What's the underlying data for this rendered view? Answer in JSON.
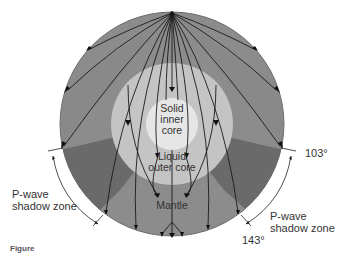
{
  "diagram": {
    "layers": [
      {
        "name": "Solid inner core",
        "lines": [
          "Solid",
          "inner",
          "core"
        ],
        "color": "#e6e6e6"
      },
      {
        "name": "Liquid outer core",
        "lines": [
          "Liquid",
          "outer core"
        ],
        "color": "#c4c4c4"
      },
      {
        "name": "Mantle",
        "lines": [
          "Mantle"
        ],
        "color": "#8c8c8c"
      }
    ],
    "shadow_zone_color": "#6a6a6a",
    "angles": {
      "start": "103°",
      "end": "143°"
    },
    "shadow_zone_left": {
      "lines": [
        "P-wave",
        "shadow zone"
      ]
    },
    "shadow_zone_right": {
      "lines": [
        "P-wave",
        "shadow zone"
      ]
    },
    "caption": "Figure"
  }
}
